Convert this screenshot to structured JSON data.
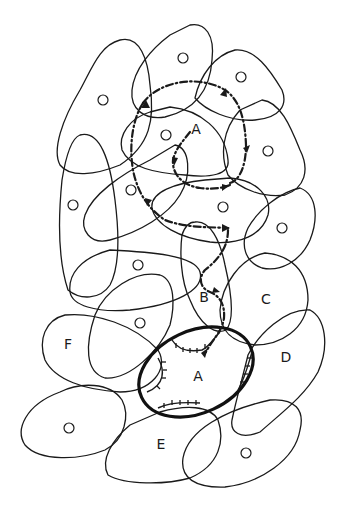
{
  "figure": {
    "region_labels": {
      "A_upper": "A",
      "A_lower": "A",
      "B": "B",
      "C": "C",
      "D": "D",
      "E": "E",
      "F": "F"
    },
    "unlabeled_marker": "O",
    "unlabeled_field_count": 15,
    "colors": {
      "ink": "#1a1a1a",
      "background": "#ffffff"
    }
  }
}
